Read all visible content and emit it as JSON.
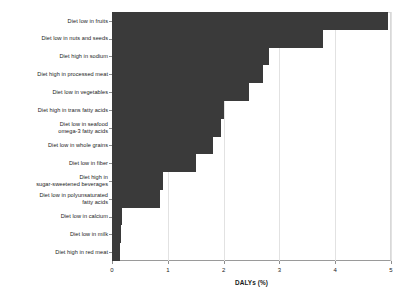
{
  "chart_data": {
    "type": "bar",
    "orientation": "horizontal",
    "title": "",
    "subtitle": "",
    "xlabel": "DALYs (%)",
    "ylabel": "",
    "xlim": [
      0,
      5
    ],
    "xticks": [
      0,
      1,
      2,
      3,
      4,
      5
    ],
    "xticklabels": [
      "0",
      "1",
      "2",
      "3",
      "4",
      "5"
    ],
    "grid": "vertical",
    "legend": null,
    "bar_color": "#3a3a3a",
    "categories": [
      "Diet low in fruits",
      "Diet low in nuts and seeds",
      "Diet high in sodium",
      "Diet high in processed meat",
      "Diet low in vegetables",
      "Diet high in trans fatty acids",
      "Diet low in seafood\nomega-3 fatty acids",
      "Diet low in whole grains",
      "Diet low in fiber",
      "Diet high in\nsugar-sweetened beverages",
      "Diet low in polyunsaturated\nfatty acids",
      "Diet low in calcium",
      "Diet low in milk",
      "Diet high in red meat"
    ],
    "values": [
      4.95,
      3.78,
      2.81,
      2.71,
      2.46,
      2.01,
      1.95,
      1.81,
      1.5,
      0.92,
      0.86,
      0.18,
      0.17,
      0.14
    ]
  }
}
